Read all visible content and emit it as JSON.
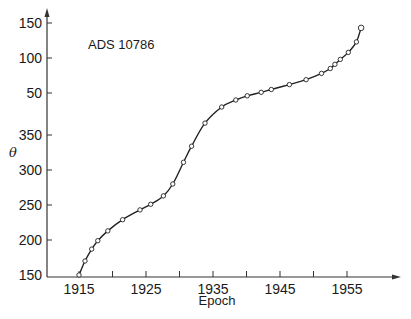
{
  "chart_data": {
    "type": "line",
    "title": "",
    "annotation": "ADS 10786",
    "xlabel": "Epoch",
    "ylabel": "θ",
    "x_ticks": [
      "1915",
      "1925",
      "1935",
      "1945",
      "1955"
    ],
    "x_minor_ticks": [
      1920,
      1930,
      1940,
      1950
    ],
    "y_ticks": [
      "150",
      "200",
      "250",
      "300",
      "350",
      "50",
      "100",
      "150"
    ],
    "y_tick_note": "Position angle wraps through 360°: bottom-to-top 150,200,250,300,350,50,100,150",
    "xlim": [
      1910,
      1962
    ],
    "ylim_continuous": [
      150,
      510
    ],
    "grid": false,
    "legend": null,
    "series": [
      {
        "name": "ADS 10786 observations",
        "marker": "open-circle",
        "x": [
          1915.0,
          1915.9,
          1916.9,
          1917.8,
          1919.3,
          1921.5,
          1924.1,
          1925.7,
          1927.6,
          1929.0,
          1930.6,
          1931.8,
          1933.8,
          1936.3,
          1938.4,
          1940.1,
          1942.2,
          1943.7,
          1946.4,
          1948.9,
          1951.2,
          1952.5,
          1953.2,
          1954.0,
          1955.2,
          1956.4,
          1957.1
        ],
        "theta_continuous": [
          150,
          170,
          187,
          199,
          213,
          229,
          243,
          251,
          263,
          280,
          311,
          334,
          367,
          390,
          400,
          406,
          411,
          415,
          422,
          429,
          438,
          445,
          451,
          458,
          468,
          483,
          503
        ],
        "theta_deg": [
          150,
          170,
          187,
          199,
          213,
          229,
          243,
          251,
          263,
          280,
          311,
          334,
          7,
          30,
          40,
          46,
          51,
          55,
          62,
          69,
          78,
          85,
          91,
          98,
          108,
          123,
          143
        ]
      }
    ]
  }
}
